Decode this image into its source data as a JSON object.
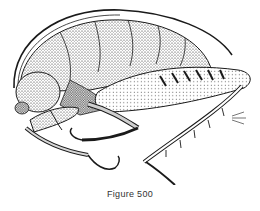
{
  "figure": {
    "style": "stipple-ink-drawing",
    "caption": "Figure 500",
    "colors": {
      "ink": "#1a1a1a",
      "background": "#ffffff",
      "caption": "#333333"
    }
  }
}
